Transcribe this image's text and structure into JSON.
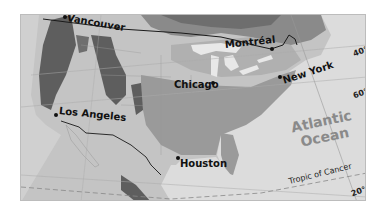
{
  "map": {
    "cities": [
      {
        "name": "Vancouver",
        "x": 44,
        "y": 2,
        "label_x": 48,
        "label_y": -2,
        "rotate": 10
      },
      {
        "name": "Montréal",
        "x": 251,
        "y": 34,
        "label_x": 205,
        "label_y": 28,
        "rotate": -6
      },
      {
        "name": "Chicago",
        "x": 191,
        "y": 67,
        "label_x": 153,
        "label_y": 64,
        "rotate": 0
      },
      {
        "name": "New York",
        "x": 259,
        "y": 61,
        "label_x": 263,
        "label_y": 56,
        "rotate": -18
      },
      {
        "name": "Los Angeles",
        "x": 34,
        "y": 99,
        "label_x": 38,
        "label_y": 91,
        "rotate": 6
      },
      {
        "name": "Houston",
        "x": 156,
        "y": 142,
        "label_x": 160,
        "label_y": 144,
        "rotate": 0
      }
    ],
    "water_labels": {
      "ocean_line1": "Atlantic",
      "ocean_line2": "Ocean"
    },
    "lines": {
      "tropic": "Tropic of Cancer"
    },
    "latitude_labels": {
      "lat40": "40°",
      "lat60": "60°",
      "lat20": "20°"
    },
    "colors": {
      "water": "#dcdcdc",
      "land_light": "#c4c4c4",
      "land_mid": "#a8a8a8",
      "land_dark": "#7a7a7a",
      "mountains": "#5e5e5e",
      "border": "#1a1a1a"
    }
  }
}
